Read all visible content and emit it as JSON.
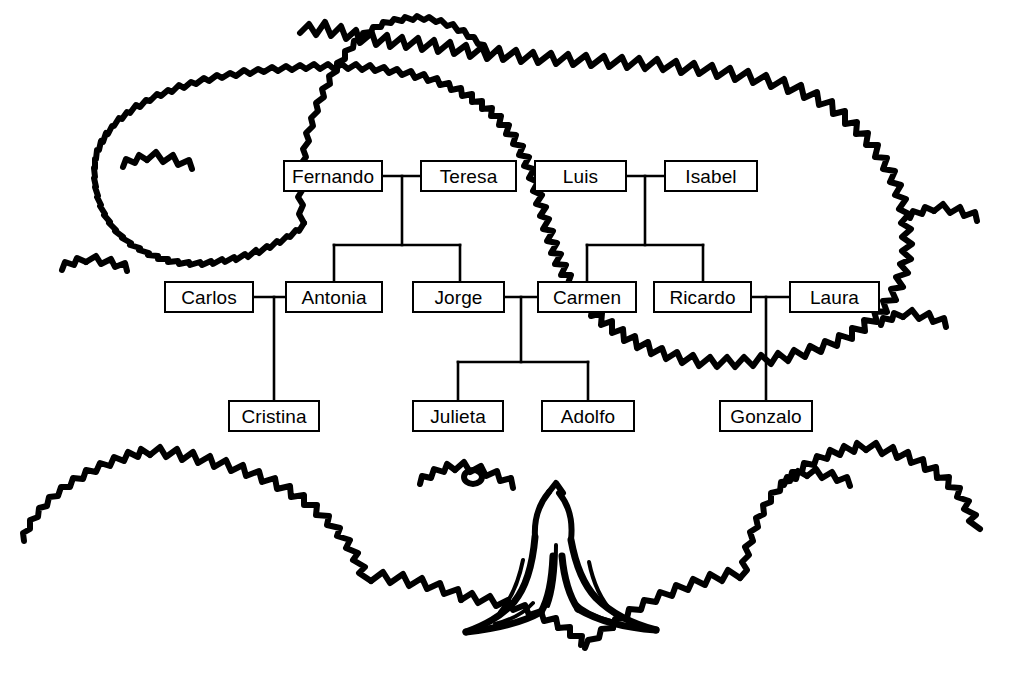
{
  "illustration": {
    "title": "family-tree-drawing",
    "ink_color": "#000000",
    "background_color": "#ffffff",
    "elements": [
      "tree-canopy-outline",
      "tree-trunk",
      "tree-roots"
    ]
  },
  "diagram": {
    "type": "family-tree",
    "generations": [
      {
        "id": "generation-1",
        "people": [
          {
            "id": "fernando",
            "name": "Fernando",
            "x": 283,
            "y": 160,
            "w": 100,
            "h": 32
          },
          {
            "id": "teresa",
            "name": "Teresa",
            "x": 420,
            "y": 160,
            "w": 97,
            "h": 32
          },
          {
            "id": "luis",
            "name": "Luis",
            "x": 534,
            "y": 160,
            "w": 93,
            "h": 32
          },
          {
            "id": "isabel",
            "name": "Isabel",
            "x": 664,
            "y": 160,
            "w": 94,
            "h": 32
          }
        ]
      },
      {
        "id": "generation-2",
        "people": [
          {
            "id": "carlos",
            "name": "Carlos",
            "x": 164,
            "y": 281,
            "w": 90,
            "h": 32
          },
          {
            "id": "antonia",
            "name": "Antonia",
            "x": 285,
            "y": 281,
            "w": 98,
            "h": 32
          },
          {
            "id": "jorge",
            "name": "Jorge",
            "x": 412,
            "y": 281,
            "w": 93,
            "h": 32
          },
          {
            "id": "carmen",
            "name": "Carmen",
            "x": 537,
            "y": 281,
            "w": 100,
            "h": 32
          },
          {
            "id": "ricardo",
            "name": "Ricardo",
            "x": 653,
            "y": 281,
            "w": 99,
            "h": 32
          },
          {
            "id": "laura",
            "name": "Laura",
            "x": 789,
            "y": 281,
            "w": 91,
            "h": 32
          }
        ]
      },
      {
        "id": "generation-3",
        "people": [
          {
            "id": "cristina",
            "name": "Cristina",
            "x": 228,
            "y": 400,
            "w": 92,
            "h": 32
          },
          {
            "id": "julieta",
            "name": "Julieta",
            "x": 412,
            "y": 400,
            "w": 92,
            "h": 32
          },
          {
            "id": "adolfo",
            "name": "Adolfo",
            "x": 541,
            "y": 400,
            "w": 94,
            "h": 32
          },
          {
            "id": "gonzalo",
            "name": "Gonzalo",
            "x": 719,
            "y": 400,
            "w": 94,
            "h": 32
          }
        ]
      }
    ],
    "marriages": [
      {
        "id": "fernando-teresa",
        "partners": [
          "Fernando",
          "Teresa"
        ],
        "children": [
          "Antonia",
          "Jorge"
        ]
      },
      {
        "id": "luis-isabel",
        "partners": [
          "Luis",
          "Isabel"
        ],
        "children": [
          "Carmen",
          "Ricardo"
        ]
      },
      {
        "id": "carlos-antonia",
        "partners": [
          "Carlos",
          "Antonia"
        ],
        "children": [
          "Cristina"
        ]
      },
      {
        "id": "jorge-carmen",
        "partners": [
          "Jorge",
          "Carmen"
        ],
        "children": [
          "Julieta",
          "Adolfo"
        ]
      },
      {
        "id": "ricardo-laura",
        "partners": [
          "Ricardo",
          "Laura"
        ],
        "children": [
          "Gonzalo"
        ]
      }
    ],
    "line_color": "#000000",
    "line_width": 2
  }
}
